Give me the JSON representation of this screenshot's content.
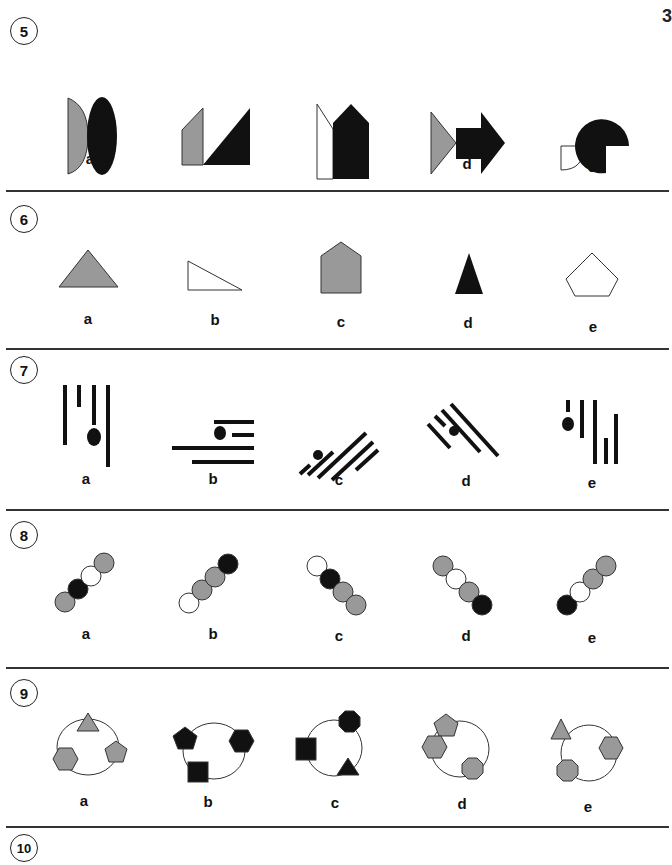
{
  "page_number": "3",
  "colors": {
    "black": "#111111",
    "gray": "#999999",
    "white": "#ffffff",
    "stroke": "#333333"
  },
  "questions": [
    {
      "number": "5",
      "options": [
        {
          "label": "a",
          "desc": "gray half-ellipse beside black ellipse"
        },
        {
          "label": "b",
          "desc": "gray trapezoid beside black right triangle"
        },
        {
          "label": "c",
          "desc": "white quadrilateral beside black house pentagon"
        },
        {
          "label": "d",
          "desc": "gray triangle beside black arrow"
        },
        {
          "label": "e",
          "desc": "white quarter-circle beside black three-quarter circle"
        }
      ]
    },
    {
      "number": "6",
      "options": [
        {
          "label": "a",
          "desc": "gray triangle"
        },
        {
          "label": "b",
          "desc": "white right triangle"
        },
        {
          "label": "c",
          "desc": "gray house pentagon"
        },
        {
          "label": "d",
          "desc": "black narrow triangle"
        },
        {
          "label": "e",
          "desc": "white pentagon"
        }
      ]
    },
    {
      "number": "7",
      "options": [
        {
          "label": "a",
          "desc": "vertical lines with dot"
        },
        {
          "label": "b",
          "desc": "horizontal lines with dot"
        },
        {
          "label": "c",
          "desc": "diagonal lines (rising) with dot"
        },
        {
          "label": "d",
          "desc": "diagonal lines (falling) with dot"
        },
        {
          "label": "e",
          "desc": "vertical lines with dot at left"
        }
      ]
    },
    {
      "number": "8",
      "options": [
        {
          "label": "a",
          "desc": "gray, black, white, gray circles rising"
        },
        {
          "label": "b",
          "desc": "white, gray, gray, black circles rising"
        },
        {
          "label": "c",
          "desc": "white, black, gray, gray circles falling"
        },
        {
          "label": "d",
          "desc": "gray, white, gray, black circles falling"
        },
        {
          "label": "e",
          "desc": "black, white, gray, gray circles rising"
        }
      ]
    },
    {
      "number": "9",
      "options": [
        {
          "label": "a",
          "desc": "circle with gray triangle, pentagon, hexagon"
        },
        {
          "label": "b",
          "desc": "circle with black pentagon, hexagon, square"
        },
        {
          "label": "c",
          "desc": "circle with black square, octagon, triangle"
        },
        {
          "label": "d",
          "desc": "circle with gray pentagon, hexagon, octagon"
        },
        {
          "label": "e",
          "desc": "circle with gray triangle, hexagon, octagon"
        }
      ]
    },
    {
      "number": "10",
      "options": []
    }
  ]
}
